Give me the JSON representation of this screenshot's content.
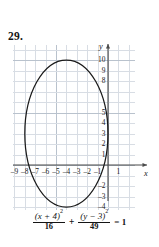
{
  "problem": {
    "number": "29."
  },
  "graph": {
    "x_axis_label": "x",
    "y_axis_label": "y",
    "x_ticks": [
      {
        "value": -9,
        "label": "–9"
      },
      {
        "value": -8,
        "label": "–8"
      },
      {
        "value": -7,
        "label": "–7"
      },
      {
        "value": -6,
        "label": "–6"
      },
      {
        "value": -5,
        "label": "–5"
      },
      {
        "value": -4,
        "label": "–4"
      },
      {
        "value": -3,
        "label": "–3"
      },
      {
        "value": -2,
        "label": "–2"
      },
      {
        "value": -1,
        "label": "–1"
      },
      {
        "value": 1,
        "label": "1"
      }
    ],
    "y_ticks": [
      {
        "value": 10,
        "label": "10"
      },
      {
        "value": 9,
        "label": "9"
      },
      {
        "value": 8,
        "label": "8"
      },
      {
        "value": 5,
        "label": "5"
      },
      {
        "value": 4,
        "label": "4"
      },
      {
        "value": 3,
        "label": "3"
      },
      {
        "value": 2,
        "label": "2"
      },
      {
        "value": 1,
        "label": "1"
      },
      {
        "value": -2,
        "label": "–2"
      },
      {
        "value": -3,
        "label": "–3"
      },
      {
        "value": -4,
        "label": "–4"
      }
    ],
    "curve_color": "#1a1a1a",
    "grid_color": "#d8dde4",
    "axis_color": "#4a4a4a"
  },
  "chart_data": {
    "type": "scatter",
    "title": "",
    "xlabel": "x",
    "ylabel": "y",
    "xlim": [
      -9.8,
      2.2
    ],
    "ylim": [
      -5.0,
      10.8
    ],
    "grid": true,
    "legend": "none",
    "curve": {
      "name": "ellipse",
      "equation": "(x + 4)^2/16 + (y - 3)^2/49 = 1",
      "shape": "ellipse",
      "center": [
        -4,
        3
      ],
      "semi_axis_x": 4,
      "semi_axis_y": 7,
      "x_range": [
        -8,
        0
      ],
      "y_range": [
        -4,
        10
      ],
      "vertices": [
        [
          -4,
          10
        ],
        [
          -4,
          -4
        ]
      ],
      "co_vertices": [
        [
          -8,
          3
        ],
        [
          0,
          3
        ]
      ]
    }
  },
  "equation": {
    "numerator_1_base": "(x + 4)",
    "numerator_1_exp": "2",
    "denominator_1": "16",
    "operator": "+",
    "numerator_2_base": "(y − 3)",
    "numerator_2_exp": "2",
    "denominator_2": "49",
    "tail": "= 1",
    "full_text": "(x + 4)²/16 + (y − 3)²/49 = 1"
  }
}
